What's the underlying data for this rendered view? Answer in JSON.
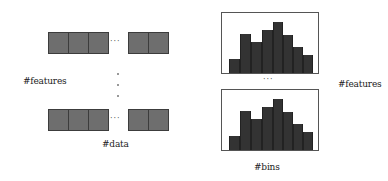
{
  "left_panel": {
    "features_label": "#features",
    "data_label": "#data",
    "row_ellipsis": "···",
    "rows": [
      {
        "top": 32,
        "left_cells": [
          48,
          68,
          88
        ],
        "right_cells": [
          128,
          148
        ],
        "dots_x": 111,
        "dots_y": 39
      },
      {
        "top": 109,
        "left_cells": [
          48,
          68,
          88
        ],
        "right_cells": [
          128,
          148
        ],
        "dots_x": 111,
        "dots_y": 116
      }
    ],
    "vertical_dots_y": [
      73,
      84,
      96
    ],
    "vertical_dots_x": 117
  },
  "right_panel": {
    "features_label": "#features",
    "bins_label": "#bins",
    "between_ellipsis": "···",
    "histograms": [
      {
        "top": 12,
        "height": 62
      },
      {
        "top": 89,
        "height": 62
      }
    ],
    "bar_heights_px": [
      14,
      39,
      31,
      43,
      51,
      38,
      26,
      18
    ]
  },
  "colors": {
    "cell_fill": "#6e6e6e",
    "cell_border": "#3c3c3c",
    "bar_fill": "#333333",
    "frame": "#555555"
  }
}
